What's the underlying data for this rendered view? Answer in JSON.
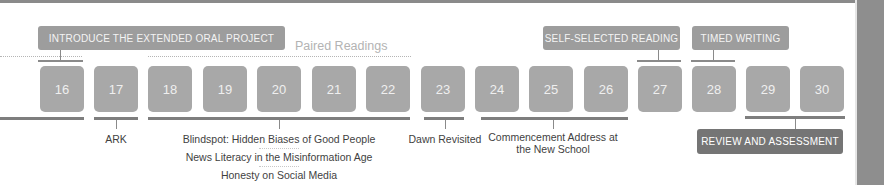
{
  "top_labels": {
    "introduce": "INTRODUCE THE EXTENDED ORAL PROJECT",
    "self_selected": "SELF-SELECTED READING",
    "timed_writing": "TIMED WRITING"
  },
  "section_title": "Paired Readings",
  "tiles": [
    "16",
    "17",
    "18",
    "19",
    "20",
    "21",
    "22",
    "23",
    "24",
    "25",
    "26",
    "27",
    "28",
    "29",
    "30"
  ],
  "captions": {
    "ark": "ARK",
    "blindspot": "Blindspot: Hidden Biases of Good People",
    "news_literacy": "News Literacy in the Misinformation Age",
    "honesty": "Honesty on Social Media",
    "dawn": "Dawn Revisited",
    "commencement_line1": "Commencement Address at",
    "commencement_line2": "the New School"
  },
  "bottom_label": "REVIEW AND ASSESSMENT",
  "colors": {
    "tile": "#a8a8a8",
    "label_box": "#9d9d9d",
    "review_box": "#757575",
    "line": "#8a8a8a"
  }
}
